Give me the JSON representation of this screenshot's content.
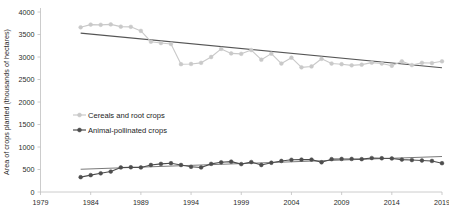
{
  "chart_data": {
    "type": "line",
    "title": "",
    "xlabel": "",
    "ylabel": "Area of crops planted (thousands of hectares)",
    "xlim": [
      1979,
      2019
    ],
    "ylim": [
      0,
      4000
    ],
    "ytick_step": 500,
    "grid": false,
    "legend_position": "center-left-inside",
    "xticks": [
      "1979",
      "1984",
      "1989",
      "1994",
      "1999",
      "2004",
      "2009",
      "2014",
      "2019"
    ],
    "yticks": [
      "0",
      "500",
      "1000",
      "1500",
      "2000",
      "2500",
      "3000",
      "3500",
      "4000"
    ],
    "x": [
      1983,
      1984,
      1985,
      1986,
      1987,
      1988,
      1989,
      1990,
      1991,
      1992,
      1993,
      1994,
      1995,
      1996,
      1997,
      1998,
      1999,
      2000,
      2001,
      2002,
      2003,
      2004,
      2005,
      2006,
      2007,
      2008,
      2009,
      2010,
      2011,
      2012,
      2013,
      2014,
      2015,
      2016,
      2017,
      2018,
      2019
    ],
    "series": [
      {
        "name": "Cereals and root crops",
        "color": "#c9c9c9",
        "marker": "circle",
        "trendline": true,
        "trendline_color": "#555555",
        "trend_start": 3530,
        "trend_end": 2760,
        "values": [
          3660,
          3720,
          3715,
          3725,
          3675,
          3670,
          3580,
          3340,
          3310,
          3290,
          2840,
          2845,
          2870,
          3000,
          3180,
          3080,
          3070,
          3155,
          2940,
          3075,
          2855,
          2985,
          2770,
          2790,
          2960,
          2855,
          2840,
          2815,
          2830,
          2875,
          2855,
          2805,
          2905,
          2820,
          2870,
          2865,
          2905
        ]
      },
      {
        "name": "Animal-pollinated crops",
        "color": "#4d4d4d",
        "marker": "circle",
        "trendline": true,
        "trendline_color": "#7a7a7a",
        "trend_start": 505,
        "trend_end": 790,
        "values": [
          330,
          375,
          415,
          455,
          545,
          550,
          545,
          600,
          625,
          640,
          600,
          560,
          545,
          625,
          660,
          675,
          620,
          665,
          600,
          650,
          690,
          715,
          720,
          720,
          660,
          730,
          735,
          735,
          730,
          755,
          750,
          745,
          720,
          710,
          700,
          690,
          640
        ]
      }
    ]
  },
  "legend": {
    "items": [
      {
        "label": "Cereals and root crops",
        "color": "#c9c9c9"
      },
      {
        "label": "Animal-pollinated crops",
        "color": "#4d4d4d"
      }
    ]
  }
}
